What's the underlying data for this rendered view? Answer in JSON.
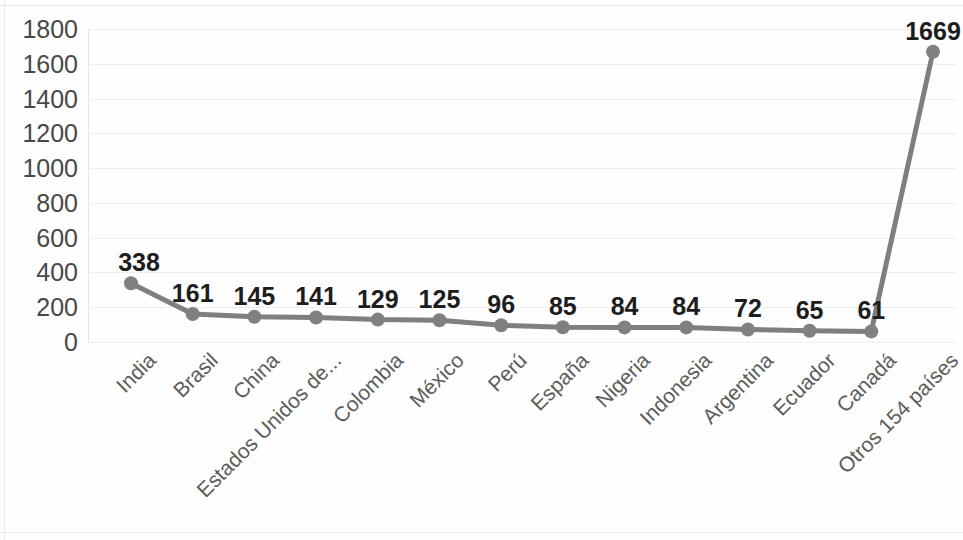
{
  "chart_data": {
    "type": "line",
    "title": "",
    "subtitle": "",
    "xlabel": "",
    "ylabel": "",
    "categories": [
      "India",
      "Brasil",
      "China",
      "Estados Unidos de...",
      "Colombia",
      "México",
      "Perú",
      "España",
      "Nigeria",
      "Indonesia",
      "Argentina",
      "Ecuador",
      "Canadá",
      "Otros 154 países"
    ],
    "values": [
      338,
      161,
      145,
      141,
      129,
      125,
      96,
      85,
      84,
      84,
      72,
      65,
      61,
      1669
    ],
    "data_labels": [
      "338",
      "161",
      "145",
      "141",
      "129",
      "125",
      "96",
      "85",
      "84",
      "84",
      "72",
      "65",
      "61",
      "1669"
    ],
    "ylim": [
      0,
      1800
    ],
    "ytick_step": 200,
    "ytick_labels": [
      "1800",
      "1600",
      "1400",
      "1200",
      "1000",
      "800",
      "600",
      "400",
      "200",
      "0"
    ],
    "ytick_values": [
      1800,
      1600,
      1400,
      1200,
      1000,
      800,
      600,
      400,
      200,
      0
    ],
    "grid": true,
    "grid_axis": "y",
    "legend": false,
    "legend_position": "none",
    "marker": "circle",
    "series": [
      {
        "name": "",
        "values": [
          338,
          161,
          145,
          141,
          129,
          125,
          96,
          85,
          84,
          84,
          72,
          65,
          61,
          1669
        ]
      }
    ]
  },
  "style": {
    "line_color": "#7f7f7f",
    "marker_color": "#808080",
    "gridline_color": "#eeeeee",
    "axis_color": "#e3e3e3",
    "tick_label_color": "#484848",
    "category_label_color": "#5c5c5c",
    "data_label_color": "#1d1d1d",
    "background_color": "#fefefe"
  }
}
